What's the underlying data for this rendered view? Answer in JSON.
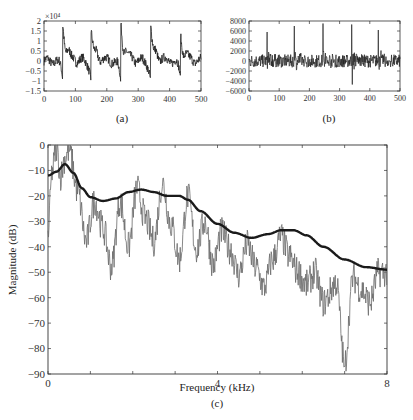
{
  "figure": {
    "panels": [
      "(a)",
      "(b)",
      "(c)"
    ]
  },
  "chart_data": [
    {
      "id": "a",
      "type": "line",
      "caption": "(a)",
      "title": "",
      "xlabel": "",
      "ylabel": "",
      "y_multiplier_label": "×10⁴",
      "xlim": [
        0,
        500
      ],
      "ylim": [
        -1.5,
        2
      ],
      "xticks": [
        0,
        100,
        200,
        300,
        400,
        500
      ],
      "yticks": [
        -1.5,
        -1,
        -0.5,
        0,
        0.5,
        1,
        1.5,
        2
      ],
      "ytick_labels": [
        "-1.5",
        "-1",
        "-0.5",
        "0",
        "0.5",
        "1",
        "1.5",
        "2"
      ],
      "grid": false,
      "color": "#222222",
      "description": "Quasi-periodic voiced speech waveform (amplitude ×10^4), sharp peaks near samples 60, 150, 245, 340, 435",
      "pulse_positions": [
        60,
        150,
        245,
        340,
        435
      ],
      "pulse_peaks": [
        1.85,
        1.55,
        1.85,
        1.65,
        1.3
      ],
      "pre_pulse_minima": [
        -1.05,
        -1.15,
        -1.4,
        -1.25,
        -1.1
      ]
    },
    {
      "id": "b",
      "type": "line",
      "caption": "(b)",
      "title": "",
      "xlabel": "",
      "ylabel": "",
      "xlim": [
        0,
        500
      ],
      "ylim": [
        -6000,
        8000
      ],
      "xticks": [
        0,
        100,
        200,
        300,
        400,
        500
      ],
      "yticks": [
        -6000,
        -4000,
        -2000,
        0,
        2000,
        4000,
        6000,
        8000
      ],
      "ytick_labels": [
        "-6000",
        "-4000",
        "-2000",
        "0",
        "2000",
        "4000",
        "6000",
        "8000"
      ],
      "grid": false,
      "color": "#222222",
      "description": "Prediction residual signal with impulses near samples 60, 150, 245, 340, 428",
      "pulse_positions": [
        60,
        150,
        245,
        340,
        428
      ],
      "pulse_peaks": [
        5800,
        7000,
        7500,
        7300,
        6200
      ],
      "min_spike": {
        "x": 340,
        "y": -4700
      }
    },
    {
      "id": "c",
      "type": "line",
      "caption": "(c)",
      "title": "",
      "xlabel": "Frequency (kHz)",
      "ylabel": "Magnitude (dB)",
      "xlim": [
        0,
        8
      ],
      "ylim": [
        -90,
        0
      ],
      "xticks": [
        0,
        1,
        2,
        3,
        4,
        5,
        6,
        7,
        8
      ],
      "xtick_labels": [
        "0",
        "",
        "",
        "",
        "4",
        "",
        "",
        "",
        "8"
      ],
      "yticks": [
        0,
        -10,
        -20,
        -30,
        -40,
        -50,
        -60,
        -70,
        -80,
        -90
      ],
      "ytick_labels": [
        "0",
        "-10",
        "-20",
        "-30",
        "-40",
        "-50",
        "-60",
        "-70",
        "-80",
        "-90"
      ],
      "grid": false,
      "legend": null,
      "series": [
        {
          "name": "LPC spectral envelope",
          "style": "thick smooth black",
          "color": "#1a1a1a",
          "x": [
            0,
            0.2,
            0.4,
            0.6,
            0.8,
            1.0,
            1.3,
            1.6,
            1.9,
            2.2,
            2.5,
            2.8,
            3.1,
            3.3,
            3.6,
            4.0,
            4.4,
            4.8,
            5.2,
            5.5,
            5.8,
            6.1,
            6.5,
            7.0,
            7.5,
            8.0
          ],
          "values": [
            -12,
            -10.5,
            -7.5,
            -11,
            -17,
            -20.5,
            -22,
            -21,
            -18.5,
            -17.5,
            -18.5,
            -20,
            -20,
            -21.5,
            -26,
            -31,
            -34.5,
            -36.5,
            -35,
            -33.5,
            -33.5,
            -35.5,
            -40,
            -45,
            -48,
            -49
          ]
        },
        {
          "name": "FFT magnitude spectrum",
          "style": "thin jagged gray",
          "color": "#666666",
          "x": [
            0,
            0.1,
            0.2,
            0.3,
            0.4,
            0.5,
            0.7,
            0.9,
            1.1,
            1.3,
            1.5,
            1.7,
            1.9,
            2.1,
            2.3,
            2.5,
            2.7,
            2.9,
            3.1,
            3.3,
            3.5,
            3.7,
            3.9,
            4.1,
            4.3,
            4.5,
            4.7,
            4.9,
            5.1,
            5.3,
            5.5,
            5.7,
            5.9,
            6.1,
            6.3,
            6.5,
            6.8,
            7.0,
            7.2,
            7.4,
            7.6,
            7.8,
            8.0
          ],
          "values": [
            -35,
            -10,
            -1,
            -12,
            -5,
            -2,
            -18,
            -38,
            -22,
            -33,
            -48,
            -22,
            -40,
            -17,
            -29,
            -38,
            -15,
            -31,
            -45,
            -20,
            -41,
            -30,
            -47,
            -34,
            -41,
            -51,
            -39,
            -48,
            -56,
            -45,
            -36,
            -44,
            -50,
            -55,
            -50,
            -62,
            -54,
            -86,
            -52,
            -57,
            -62,
            -50,
            -50
          ],
          "notable_min": {
            "x": 7.0,
            "y": -87
          }
        }
      ]
    }
  ]
}
